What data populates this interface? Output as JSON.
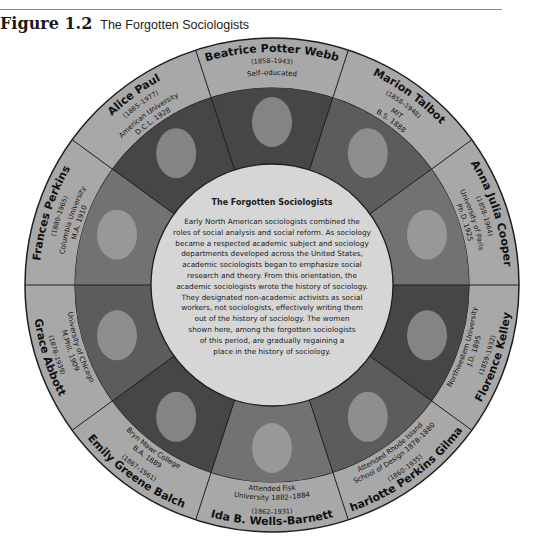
{
  "figure": {
    "number": "Figure 1.2",
    "title": "The Forgotten Sociologists"
  },
  "center": {
    "title": "The Forgotten Sociologists",
    "body_lines": [
      "Early North American sociologists combined the",
      "roles of social analysis and social reform. As sociology",
      "became a respected academic subject and sociology",
      "departments developed across the United States,",
      "academic sociologists began to emphasize social",
      "research and theory. From this orientation, the",
      "academic sociologists wrote the history of sociology.",
      "They designated non-academic activists as social",
      "workers, not sociologists, effectively writing them",
      "out of the history of sociology. The women",
      "shown here, among the forgotten sociologists",
      "of this period, are gradually regaining a",
      "place in the history of sociology."
    ]
  },
  "sociologists": [
    {
      "name": "Beatrice Potter Webb",
      "years": "(1858–1943)",
      "education": [
        "Self–educated"
      ],
      "position": "top"
    },
    {
      "name": "Marion Talbot",
      "years": "(1858–1948)",
      "education": [
        "MIT",
        "B.S. 1888"
      ],
      "position": "top-right"
    },
    {
      "name": "Anna Julia Cooper",
      "years": "(1858–1964)",
      "education": [
        "University of Paris",
        "Ph.D. 1925"
      ],
      "position": "right-upper"
    },
    {
      "name": "Florence Kelley",
      "years": "(1859–1932)",
      "education": [
        "Northwestern University",
        "J.D. 1895"
      ],
      "position": "right-lower"
    },
    {
      "name": "Charlotte Perkins Gilman",
      "years": "(1860–1935)",
      "education": [
        "Attended Rhode Island",
        "School of Design 1878–1880"
      ],
      "position": "bottom-right"
    },
    {
      "name": "Ida B. Wells-Barnett",
      "years": "(1862–1931)",
      "education": [
        "Attended Fisk",
        "University 1882–1884"
      ],
      "position": "bottom"
    },
    {
      "name": "Emily Greene Balch",
      "years": "(1867–1961)",
      "education": [
        "Bryn Mawr College",
        "B.A. 1889"
      ],
      "position": "bottom-left"
    },
    {
      "name": "Grace Abbott",
      "years": "(1878–1939)",
      "education": [
        "University of Chicago",
        "M.Phil. 1909"
      ],
      "position": "left-lower"
    },
    {
      "name": "Frances Perkins",
      "years": "(1880–1965)",
      "education": [
        "Columbia University",
        "M.A. 1910"
      ],
      "position": "left-upper"
    },
    {
      "name": "Alice Paul",
      "years": "(1885–1977)",
      "education": [
        "American University",
        "D.C.L. 1928"
      ],
      "position": "top-left"
    }
  ],
  "colors": {
    "band": "#a8a8a8",
    "center": "#d6d6d6",
    "outline": "#1e1e1e"
  }
}
